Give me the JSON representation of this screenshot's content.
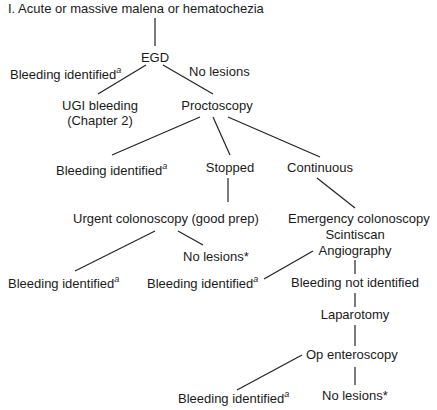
{
  "title": "I.  Acute or massive malena or hematochezia",
  "nodes": {
    "egd": "EGD",
    "egd_bleeding": "Bleeding identified",
    "egd_no_lesions": "No lesions",
    "ugi_line1": "UGI bleeding",
    "ugi_line2": "(Chapter 2)",
    "proctoscopy": "Proctoscopy",
    "procto_bleeding": "Bleeding identified",
    "stopped": "Stopped",
    "continuous": "Continuous",
    "urgent_colonoscopy": "Urgent colonoscopy (good prep)",
    "urgent_bleeding": "Bleeding identified",
    "urgent_no_lesions": "No lesions*",
    "emergency_colonoscopy": "Emergency colonoscopy",
    "scintiscan": "Scintiscan",
    "angiography": "Angiography",
    "angio_bleeding": "Bleeding identified",
    "bleeding_not_identified": "Bleeding not identified",
    "laparotomy": "Laparotomy",
    "op_enteroscopy": "Op enteroscopy",
    "op_bleeding": "Bleeding identified",
    "op_no_lesions": "No lesions*"
  },
  "footnote_marker": "a",
  "colors": {
    "line": "#222222",
    "text": "#1a1a1a",
    "background": "#ffffff"
  }
}
